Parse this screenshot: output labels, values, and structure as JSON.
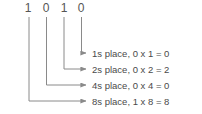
{
  "diagram": {
    "binary_number": "1010",
    "digits": [
      {
        "value": "1",
        "x": 28
      },
      {
        "value": "0",
        "x": 46
      },
      {
        "value": "1",
        "x": 64
      },
      {
        "value": "0",
        "x": 81
      }
    ],
    "labels": [
      {
        "text": "1s place, 0 x 1 = 0"
      },
      {
        "text": "2s place, 0 x 2 = 2"
      },
      {
        "text": "4s place, 0 x 4 = 0"
      },
      {
        "text": "8s place, 1 x 8 = 8"
      }
    ],
    "colors": {
      "background": "#ffffff",
      "line": "#8a8a8a",
      "digit_text": "#555555",
      "label_text": "#4a4a4a"
    }
  }
}
